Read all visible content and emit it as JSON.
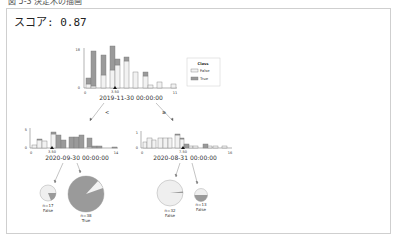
{
  "caption": "図 5-3 決定木の描画",
  "score": {
    "label": "スコア:",
    "value": "0.87"
  },
  "legend": {
    "title": "Class",
    "items": [
      {
        "label": "False",
        "color": "#f2f2f2"
      },
      {
        "label": "True",
        "color": "#9a9a9a"
      }
    ]
  },
  "colors": {
    "false_fill": "#f2f2f2",
    "true_fill": "#9a9a9a",
    "edge": "#666666",
    "frame": "#cfcfcf"
  },
  "tree": {
    "root": {
      "split_label": "2019-11-30 00:00:00",
      "threshold": "3.50",
      "xmin": "0",
      "xmax": "11",
      "ymax": "18",
      "ymin": "0"
    },
    "edges": {
      "left": "<",
      "right": "≥"
    },
    "left": {
      "split_label": "2020-09-30 00:00:00",
      "threshold": "3.50",
      "xmin": "0",
      "xmax": "14",
      "ymax": "5",
      "ymin": "0"
    },
    "right": {
      "split_label": "2020-08-31 00:00:00",
      "threshold": "7.50",
      "xmin": "0",
      "xmax": "16",
      "ymax": "1",
      "ymin": "0"
    },
    "leaves": [
      {
        "n": "n=17",
        "class": "False"
      },
      {
        "n": "n=38",
        "class": "True"
      },
      {
        "n": "n=32",
        "class": "False"
      },
      {
        "n": "n=13",
        "class": "False"
      }
    ]
  }
}
